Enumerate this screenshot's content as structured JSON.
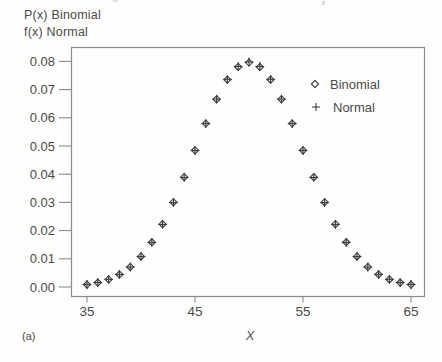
{
  "figure": {
    "ylabel_line1": "P(x) Binomial",
    "ylabel_line2": "f(x) Normal",
    "xlabel": "X",
    "corner_label": "(a)"
  },
  "colors": {
    "ink": "#4a4a4a",
    "marker": "#3c3c3c",
    "frame": "#8a8a8a",
    "background": "#fefefe"
  },
  "chart_data": {
    "type": "scatter",
    "title": "",
    "xlabel": "X",
    "ylabel": "P(x) Binomial / f(x) Normal",
    "grid": false,
    "legend_position": "upper right",
    "xlim": [
      33.6,
      66.2
    ],
    "ylim": [
      -0.004,
      0.085
    ],
    "x_tick_values": [
      35,
      45,
      55,
      65
    ],
    "x_tick_labels": [
      "35",
      "45",
      "55",
      "65"
    ],
    "y_tick_values": [
      0.0,
      0.01,
      0.02,
      0.03,
      0.04,
      0.05,
      0.06,
      0.07,
      0.08
    ],
    "y_tick_labels": [
      "0.00",
      "0.01",
      "0.02",
      "0.03",
      "0.04",
      "0.05",
      "0.06",
      "0.07",
      "0.08"
    ],
    "x": [
      35,
      36,
      37,
      38,
      39,
      40,
      41,
      42,
      43,
      44,
      45,
      46,
      47,
      48,
      49,
      50,
      51,
      52,
      53,
      54,
      55,
      56,
      57,
      58,
      59,
      60,
      61,
      62,
      63,
      64,
      65
    ],
    "series": [
      {
        "name": "Binomial",
        "marker": "diamond",
        "values": [
          0.00086,
          0.00156,
          0.0027,
          0.00447,
          0.00711,
          0.01084,
          0.01587,
          0.02229,
          0.03007,
          0.03895,
          0.04847,
          0.05796,
          0.06659,
          0.07353,
          0.07803,
          0.07959,
          0.07803,
          0.07353,
          0.06659,
          0.05796,
          0.04847,
          0.03895,
          0.03007,
          0.02229,
          0.01587,
          0.01084,
          0.00711,
          0.00447,
          0.0027,
          0.00156,
          0.00086
        ]
      },
      {
        "name": "Normal",
        "marker": "plus",
        "values": [
          0.00089,
          0.00158,
          0.00272,
          0.00448,
          0.00709,
          0.0108,
          0.01579,
          0.02218,
          0.02994,
          0.03884,
          0.04839,
          0.05793,
          0.06664,
          0.07365,
          0.07821,
          0.07979,
          0.07821,
          0.07365,
          0.06664,
          0.05793,
          0.04839,
          0.03884,
          0.02994,
          0.02218,
          0.01579,
          0.0108,
          0.00709,
          0.00448,
          0.00272,
          0.00158,
          0.00089
        ]
      }
    ]
  }
}
